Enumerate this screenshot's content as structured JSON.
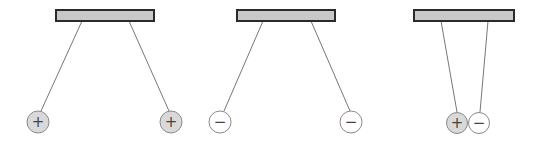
{
  "diagram": {
    "colors": {
      "bar_fill": "#c8c8c8",
      "bar_stroke": "#2b2b2b",
      "string": "#777777",
      "positive_fill": "#d9d9d9",
      "negative_fill": "#ffffff",
      "ball_stroke": "#8a8a8a"
    },
    "panels": [
      {
        "name": "like-positive-repel",
        "bar": {
          "x": 56,
          "y": 10,
          "w": 98,
          "h": 11
        },
        "strings": [
          {
            "x1": 82,
            "y1": 21,
            "x2": 41,
            "y2": 111
          },
          {
            "x1": 129,
            "y1": 21,
            "x2": 169,
            "y2": 111
          }
        ],
        "balls": [
          {
            "cx": 38,
            "cy": 122,
            "r": 11,
            "charge": "positive",
            "label": "+"
          },
          {
            "cx": 171,
            "cy": 122,
            "r": 11,
            "charge": "positive",
            "label": "+"
          }
        ]
      },
      {
        "name": "like-negative-repel",
        "bar": {
          "x": 237,
          "y": 10,
          "w": 98,
          "h": 11
        },
        "strings": [
          {
            "x1": 263,
            "y1": 21,
            "x2": 224,
            "y2": 111
          },
          {
            "x1": 311,
            "y1": 21,
            "x2": 350,
            "y2": 111
          }
        ],
        "balls": [
          {
            "cx": 220,
            "cy": 122,
            "r": 11,
            "charge": "negative",
            "label": "−"
          },
          {
            "cx": 351,
            "cy": 122,
            "r": 11,
            "charge": "negative",
            "label": "−"
          }
        ]
      },
      {
        "name": "opposite-attract",
        "bar": {
          "x": 414,
          "y": 10,
          "w": 100,
          "h": 11
        },
        "strings": [
          {
            "x1": 441,
            "y1": 21,
            "x2": 457,
            "y2": 112
          },
          {
            "x1": 488,
            "y1": 21,
            "x2": 480,
            "y2": 112
          }
        ],
        "balls": [
          {
            "cx": 457,
            "cy": 123,
            "r": 10.5,
            "charge": "positive",
            "label": "+"
          },
          {
            "cx": 479,
            "cy": 123,
            "r": 10.5,
            "charge": "negative",
            "label": "−"
          }
        ]
      }
    ]
  }
}
